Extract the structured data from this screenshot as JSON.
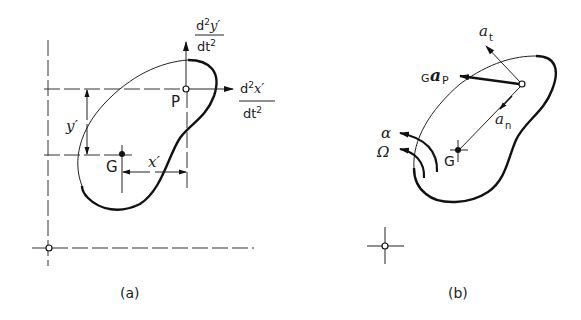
{
  "figure": {
    "panel_a": {
      "caption": "(a)",
      "point_p_label": "P",
      "point_g_label": "G",
      "dim_x_label": "x′",
      "dim_y_label": "y′",
      "accel_x": {
        "numerator_d": "d",
        "numerator_exp": "2",
        "numerator_var": "x′",
        "denominator": "dt",
        "denominator_exp": "2"
      },
      "accel_y": {
        "numerator_d": "d",
        "numerator_exp": "2",
        "numerator_var": "y′",
        "denominator": "dt",
        "denominator_exp": "2"
      }
    },
    "panel_b": {
      "caption": "(b)",
      "point_g_label": "G",
      "accel_gp_prefix": "G",
      "accel_gp_symbol": "a",
      "accel_gp_suffix": "P",
      "tangential_symbol": "a",
      "tangential_sub": "t",
      "normal_symbol": "a",
      "normal_sub": "n",
      "alpha_label": "α",
      "omega_label": "Ω"
    }
  }
}
